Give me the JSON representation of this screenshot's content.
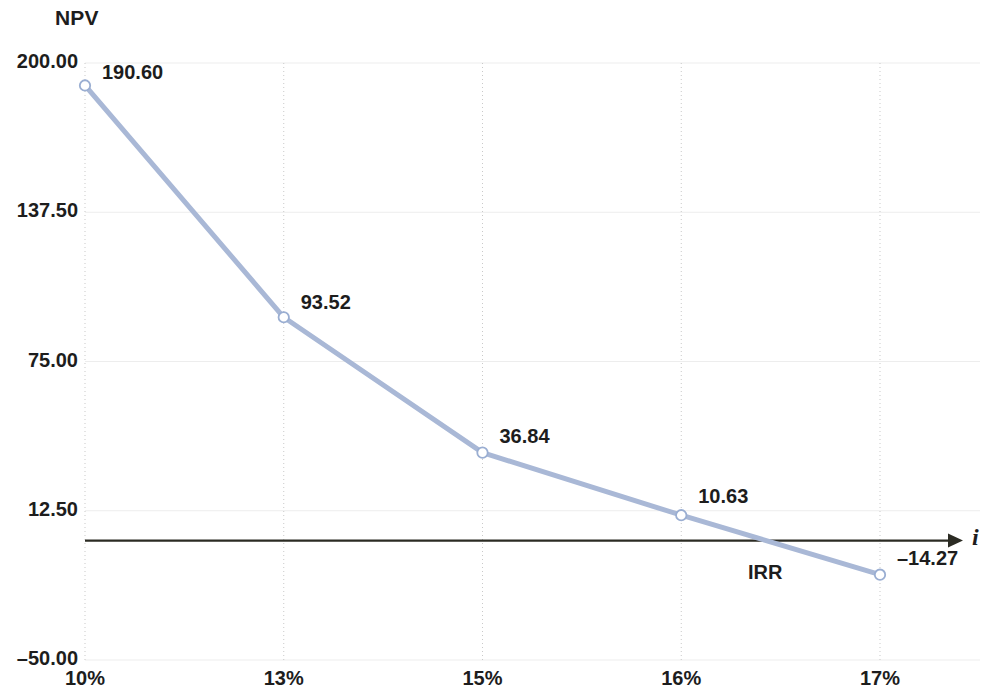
{
  "chart_data": {
    "type": "line",
    "title": "",
    "ylabel": "NPV",
    "xlabel": "i",
    "categories": [
      "10%",
      "13%",
      "15%",
      "16%",
      "17%"
    ],
    "x": [
      10,
      13,
      15,
      16,
      17
    ],
    "values": [
      190.6,
      93.52,
      36.84,
      10.63,
      -14.27
    ],
    "point_labels": [
      "190.60",
      "93.52",
      "36.84",
      "10.63",
      "–14.27"
    ],
    "ylim": [
      -50.0,
      200.0
    ],
    "y_ticks": [
      200.0,
      137.5,
      75.0,
      12.5,
      -50.0
    ],
    "y_tick_labels": [
      "200.00",
      "137.50",
      "75.00",
      "12.50",
      "–50.00"
    ],
    "x_tick_labels": [
      "10%",
      "13%",
      "15%",
      "16%",
      "17%"
    ],
    "grid": true,
    "grid_style": "dotted-vertical",
    "legend": "none",
    "annotations": [
      {
        "text": "IRR",
        "near_x": 16.5,
        "near_y": 0,
        "note": "zero crossing of NPV curve"
      }
    ],
    "zero_axis": {
      "value": 0,
      "style": "solid-arrow",
      "label": "i"
    },
    "series_color": "#a9b8d6",
    "marker": "open-circle",
    "axis_color": "#2b2b23",
    "gridline_color": "#c9c9c9",
    "text_color": "#1d1d1d"
  },
  "labels": {
    "npv_axis_title": "NPV",
    "i_axis_title": "i",
    "irr": "IRR"
  }
}
